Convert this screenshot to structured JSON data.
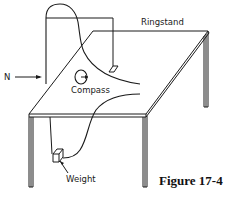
{
  "figure": {
    "caption": "Figure 17-4",
    "labels": {
      "ringstand": "Ringstand",
      "compass": "Compass",
      "weight": "Weight",
      "north": "N"
    },
    "colors": {
      "line": "#1a1a1a",
      "background": "#ffffff"
    },
    "components": [
      "table",
      "ringstand",
      "compass",
      "weight",
      "current-carrying-wire",
      "north-arrow"
    ]
  }
}
